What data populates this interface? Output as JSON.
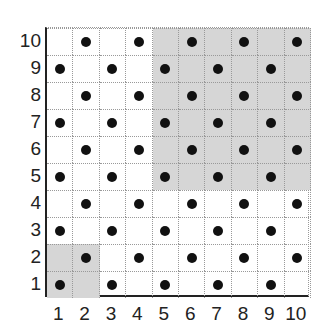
{
  "grid": {
    "cols": 10,
    "rows": 10,
    "x_labels": [
      "1",
      "2",
      "3",
      "4",
      "5",
      "6",
      "7",
      "8",
      "9",
      "10"
    ],
    "y_labels": [
      "1",
      "2",
      "3",
      "4",
      "5",
      "6",
      "7",
      "8",
      "9",
      "10"
    ],
    "dot_rule": "dot where (col + row) is even",
    "shaded_regions": [
      {
        "cols": [
          5,
          10
        ],
        "rows": [
          5,
          10
        ]
      },
      {
        "cols": [
          1,
          2
        ],
        "rows": [
          1,
          2
        ]
      }
    ],
    "colors": {
      "shade": "#d6d6d6",
      "dot": "#111111",
      "grid": "#999999",
      "axis": "#222222"
    }
  }
}
